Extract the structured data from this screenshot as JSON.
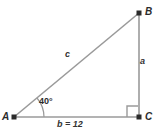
{
  "figure": {
    "type": "right-triangle-diagram",
    "background_color": "#ffffff",
    "line_color": "#9a9a9a",
    "vertex_color": "#2b2b2b",
    "text_color": "#2b2b2b",
    "vertices": {
      "A": {
        "label": "A",
        "x": 14,
        "y": 117
      },
      "B": {
        "label": "B",
        "x": 139,
        "y": 13
      },
      "C": {
        "label": "C",
        "x": 139,
        "y": 117
      }
    },
    "sides": {
      "a": {
        "label": "a",
        "from": "B",
        "to": "C"
      },
      "b": {
        "label": "b = 12",
        "from": "A",
        "to": "C",
        "value": 12
      },
      "c": {
        "label": "c",
        "from": "A",
        "to": "B"
      }
    },
    "angles": {
      "at_A": {
        "label": "40°",
        "value": 40,
        "unit": "degrees",
        "marker": "arc"
      },
      "at_C": {
        "label": "",
        "value": 90,
        "unit": "degrees",
        "marker": "right-angle-square"
      }
    }
  }
}
